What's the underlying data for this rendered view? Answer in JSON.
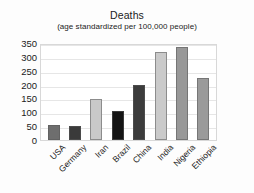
{
  "chart_data": {
    "type": "bar",
    "title": "Deaths",
    "subtitle": "(age standardized per 100,000 people)",
    "xlabel": "",
    "ylabel": "",
    "ylim": [
      0,
      350
    ],
    "yticks": [
      0,
      50,
      100,
      150,
      200,
      250,
      300,
      350
    ],
    "ytick_labels": [
      "0",
      "50",
      "100",
      "150",
      "200",
      "250",
      "300",
      "350"
    ],
    "grid": true,
    "legend": false,
    "categories": [
      "USA",
      "Germany",
      "Iran",
      "Brazil",
      "China",
      "India",
      "Nigeria",
      "Ethiopia"
    ],
    "values": [
      55,
      50,
      148,
      105,
      200,
      318,
      335,
      225
    ],
    "bar_colors": [
      "#6e6e6e",
      "#3a3a3a",
      "#c9c9c9",
      "#151515",
      "#3c3c3c",
      "#cacaca",
      "#989898",
      "#9a9a9a"
    ],
    "bars": [
      {
        "category": "USA",
        "value": 55,
        "color": "#6e6e6e"
      },
      {
        "category": "Germany",
        "value": 50,
        "color": "#3a3a3a"
      },
      {
        "category": "Iran",
        "value": 148,
        "color": "#c9c9c9"
      },
      {
        "category": "Brazil",
        "value": 105,
        "color": "#151515"
      },
      {
        "category": "China",
        "value": 200,
        "color": "#3c3c3c"
      },
      {
        "category": "India",
        "value": 318,
        "color": "#cacaca"
      },
      {
        "category": "Nigeria",
        "value": 335,
        "color": "#989898"
      },
      {
        "category": "Ethiopia",
        "value": 225,
        "color": "#9a9a9a"
      }
    ]
  },
  "style": {
    "background": "#fdfdfd",
    "plot_background": "#ffffff",
    "gridline_color": "#e6e6e6",
    "border_color": "#d8d8d8",
    "text_color": "#1b1b1b"
  }
}
